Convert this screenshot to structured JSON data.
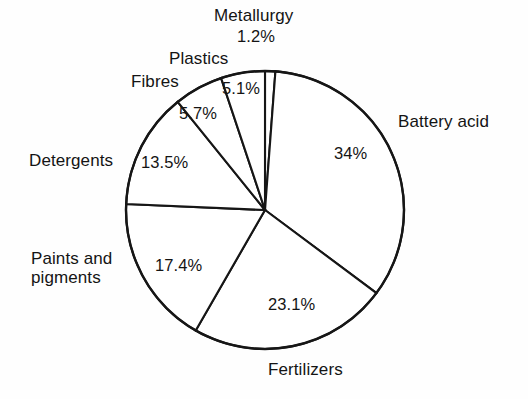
{
  "chart_data": {
    "type": "pie",
    "title": "",
    "subtitle": "",
    "xlabel": "",
    "ylabel": "",
    "legend_position": "none",
    "grid": false,
    "labels_outside": true,
    "units": "%",
    "categories": [
      "Metallurgy",
      "Battery acid",
      "Fertilizers",
      "Paints and pigments",
      "Detergents",
      "Fibres",
      "Plastics"
    ],
    "values": [
      1.2,
      34,
      23.1,
      17.4,
      13.5,
      5.7,
      5.1
    ],
    "value_labels": [
      "1.2%",
      "34%",
      "23.1%",
      "17.4%",
      "13.5%",
      "5.7%",
      "5.1%"
    ],
    "slices": [
      {
        "name": "Metallurgy",
        "value": 1.2,
        "value_label": "1.2%",
        "start_angle": 0.0,
        "end_angle": 4.3
      },
      {
        "name": "Battery acid",
        "value": 34,
        "value_label": "34%",
        "start_angle": 4.3,
        "end_angle": 126.7
      },
      {
        "name": "Fertilizers",
        "value": 23.1,
        "value_label": "23.1%",
        "start_angle": 126.7,
        "end_angle": 209.9
      },
      {
        "name": "Paints and pigments",
        "value": 17.4,
        "value_label": "17.4%",
        "start_angle": 209.9,
        "end_angle": 272.5
      },
      {
        "name": "Detergents",
        "value": 13.5,
        "value_label": "13.5%",
        "start_angle": 272.5,
        "end_angle": 321.1
      },
      {
        "name": "Fibres",
        "value": 5.7,
        "value_label": "5.7%",
        "start_angle": 321.1,
        "end_angle": 341.6
      },
      {
        "name": "Plastics",
        "value": 5.1,
        "value_label": "5.1%",
        "start_angle": 341.6,
        "end_angle": 360.0
      }
    ],
    "geometry": {
      "center_x": 265,
      "center_y": 210,
      "radius": 139
    },
    "style": {
      "slice_fill": "#ffffff",
      "stroke": "#161616",
      "background": "#fefefe",
      "text": "#141414"
    }
  },
  "labels": {
    "metallurgy_name": "Metallurgy",
    "metallurgy_value": "1.2%",
    "plastics_name": "Plastics",
    "plastics_value": "5.1%",
    "fibres_name": "Fibres",
    "fibres_value": "5.7%",
    "detergents_name": "Detergents",
    "detergents_value": "13.5%",
    "paints_name_line1": "Paints and",
    "paints_name_line2": "pigments",
    "paints_value": "17.4%",
    "fertilizers_name": "Fertilizers",
    "fertilizers_value": "23.1%",
    "battery_name": "Battery acid",
    "battery_value": "34%"
  }
}
